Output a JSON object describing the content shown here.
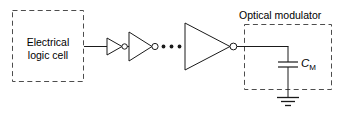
{
  "figure": {
    "stroke_color": "#1a1a1a",
    "dash_color": "#4d4d4d",
    "background": "#ffffff"
  },
  "logic_cell": {
    "label_line1": "Electrical",
    "label_line2": "logic cell",
    "box": {
      "x": 12,
      "y": 10,
      "width": 72,
      "height": 72,
      "style": "dashed"
    }
  },
  "buffer_chain": {
    "ellipsis": "• • •",
    "dot_count": 3,
    "inverters": [
      {
        "name": "inverter-1",
        "x": 107,
        "y": 46,
        "size": 11
      },
      {
        "name": "inverter-2",
        "x": 129,
        "y": 46,
        "size": 15
      },
      {
        "name": "inverter-3",
        "x": 185,
        "y": 46,
        "size": 24
      }
    ]
  },
  "optical_modulator": {
    "label": "Optical modulator",
    "box": {
      "x": 244,
      "y": 24,
      "width": 88,
      "height": 66,
      "style": "dashed"
    },
    "capacitor": {
      "label_symbol": "C",
      "label_subscript": "M",
      "node_x": 288,
      "plate_top_y": 62,
      "plate_bottom_y": 67
    },
    "ground": {
      "x": 288,
      "y": 97,
      "symbol": "earth-ground"
    }
  }
}
